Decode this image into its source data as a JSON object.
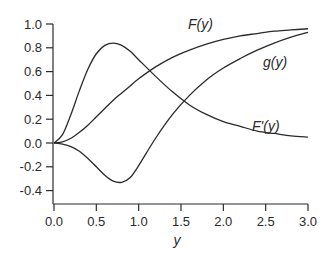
{
  "chart_data": {
    "type": "line",
    "title": "",
    "xlabel": "y",
    "ylabel": "",
    "xlim": [
      0.0,
      3.0
    ],
    "ylim": [
      -0.5,
      1.0
    ],
    "grid": false,
    "legend": "inline curve labels",
    "x_ticks": [
      "0.0",
      "0.5",
      "1.0",
      "1.5",
      "2.0",
      "2.5",
      "3.0"
    ],
    "y_ticks": [
      "1.0",
      "0.8",
      "0.6",
      "0.4",
      "0.2",
      "0.0",
      "-0.2",
      "-0.4"
    ],
    "x": [
      0.0,
      0.1,
      0.2,
      0.3,
      0.4,
      0.5,
      0.6,
      0.7,
      0.8,
      0.9,
      1.0,
      1.2,
      1.4,
      1.6,
      1.8,
      2.0,
      2.2,
      2.4,
      2.6,
      2.8,
      3.0
    ],
    "series": [
      {
        "name": "F(y)",
        "values": [
          0.0,
          0.01,
          0.04,
          0.09,
          0.15,
          0.22,
          0.29,
          0.36,
          0.42,
          0.48,
          0.54,
          0.64,
          0.72,
          0.78,
          0.83,
          0.87,
          0.9,
          0.92,
          0.94,
          0.95,
          0.96
        ]
      },
      {
        "name": "F'(y)",
        "values": [
          0.0,
          0.07,
          0.24,
          0.44,
          0.62,
          0.75,
          0.82,
          0.84,
          0.82,
          0.77,
          0.7,
          0.56,
          0.43,
          0.32,
          0.24,
          0.18,
          0.14,
          0.1,
          0.08,
          0.06,
          0.05
        ]
      },
      {
        "name": "g(y)",
        "values": [
          0.0,
          -0.01,
          -0.03,
          -0.07,
          -0.13,
          -0.2,
          -0.27,
          -0.32,
          -0.33,
          -0.29,
          -0.19,
          0.04,
          0.24,
          0.4,
          0.53,
          0.63,
          0.71,
          0.78,
          0.84,
          0.89,
          0.93
        ]
      }
    ],
    "annotations": [
      {
        "text": "F(y)",
        "x": 1.88,
        "y": 0.87
      },
      {
        "text": "g(y)",
        "x": 2.15,
        "y": 0.6
      },
      {
        "text": "F'(y)",
        "x": 2.4,
        "y": 0.25
      }
    ]
  },
  "labels": {
    "x_axis_title": "y",
    "curve_F": "F(y)",
    "curve_g": "g(y)",
    "curve_Fprime": "F'(y)"
  },
  "style": {
    "line_color": "#2a2a2a",
    "axis_color": "#2a2a2a",
    "background": "#ffffff"
  }
}
